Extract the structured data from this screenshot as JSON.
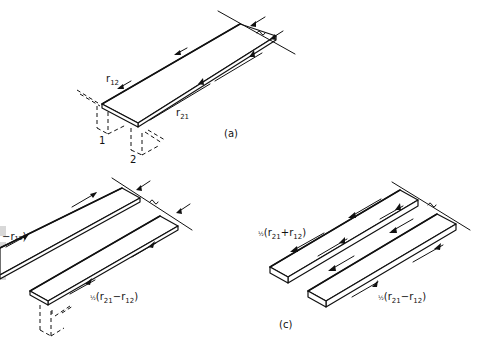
{
  "figure": {
    "panels": [
      {
        "id": "a",
        "label": "(a)",
        "description": "single strip with shear flows",
        "annotations": {
          "r12": {
            "symbol": "r",
            "subscript": "12"
          },
          "r21": {
            "symbol": "r",
            "subscript": "21"
          },
          "node1": "1",
          "node2": "2"
        }
      },
      {
        "id": "b",
        "label": "",
        "description": "two parallel strips (partially cropped at left)",
        "annotations": {
          "left_label": "−r₁₂)",
          "bottom_label": {
            "frac": "½",
            "text": "(r",
            "sub1": "21",
            "minus": "−r",
            "sub2": "12",
            "close": ")"
          }
        }
      },
      {
        "id": "c",
        "label": "(c)",
        "description": "two parallel strips split into symmetric and antisymmetric parts",
        "annotations": {
          "top_label": {
            "frac": "½",
            "text": "(r",
            "sub1": "21",
            "plus": "+r",
            "sub2": "12",
            "close": ")"
          },
          "bottom_label": {
            "frac": "½",
            "text": "(r",
            "sub1": "21",
            "minus": "−r",
            "sub2": "12",
            "close": ")"
          }
        }
      }
    ]
  }
}
